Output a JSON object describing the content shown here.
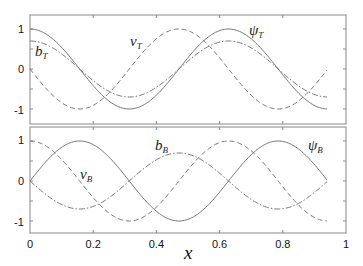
{
  "chart_data": [
    {
      "type": "line",
      "panel": "top",
      "xlim": [
        0,
        1
      ],
      "ylim": [
        -1.3,
        1.35
      ],
      "yticks": [
        -1,
        0,
        1
      ],
      "ytick_labels": [
        "-1",
        "0",
        "1"
      ],
      "x_domain": [
        0,
        0.94
      ],
      "series": [
        {
          "name": "psi_T",
          "label": "ψ",
          "sub": "T",
          "style": "solid",
          "formula": "cos(10x)",
          "amp": 1.0,
          "fn": "cos"
        },
        {
          "name": "b_T",
          "label": "b",
          "sub": "T",
          "style": "dashdot",
          "formula": "0.7 cos(10x)",
          "amp": 0.7,
          "fn": "cos"
        },
        {
          "name": "v_T",
          "label": "v",
          "sub": "T",
          "style": "dashed",
          "formula": "-sin(10x)",
          "amp": -1.0,
          "fn": "sin"
        }
      ]
    },
    {
      "type": "line",
      "panel": "bottom",
      "xlim": [
        0,
        1
      ],
      "ylim": [
        -1.3,
        1.35
      ],
      "yticks": [
        -1,
        0,
        1
      ],
      "ytick_labels": [
        "-1",
        "0",
        "1"
      ],
      "xticks": [
        0,
        0.2,
        0.4,
        0.6,
        0.8,
        1
      ],
      "xtick_labels": [
        "0",
        "0.2",
        "0.4",
        "0.6",
        "0.8",
        "1"
      ],
      "xlabel": "x",
      "x_domain": [
        0,
        0.94
      ],
      "series": [
        {
          "name": "psi_B",
          "label": "ψ",
          "sub": "B",
          "style": "solid",
          "formula": "sin(10x)",
          "amp": 1.0,
          "fn": "sin"
        },
        {
          "name": "b_B",
          "label": "b",
          "sub": "B",
          "style": "dashdot",
          "formula": "-0.7 sin(10x)",
          "amp": -0.7,
          "fn": "sin"
        },
        {
          "name": "v_B",
          "label": "v",
          "sub": "B",
          "style": "dashed",
          "formula": "cos(10x)",
          "amp": 1.0,
          "fn": "cos"
        }
      ]
    }
  ],
  "labels": {
    "xlabel": "x",
    "top": {
      "psi_T": {
        "main": "ψ",
        "sub": "T"
      },
      "b_T": {
        "main": "b",
        "sub": "T"
      },
      "v_T": {
        "main": "v",
        "sub": "T"
      }
    },
    "bottom": {
      "psi_B": {
        "main": "ψ",
        "sub": "B"
      },
      "b_B": {
        "main": "b",
        "sub": "B"
      },
      "v_B": {
        "main": "v",
        "sub": "B"
      }
    }
  }
}
